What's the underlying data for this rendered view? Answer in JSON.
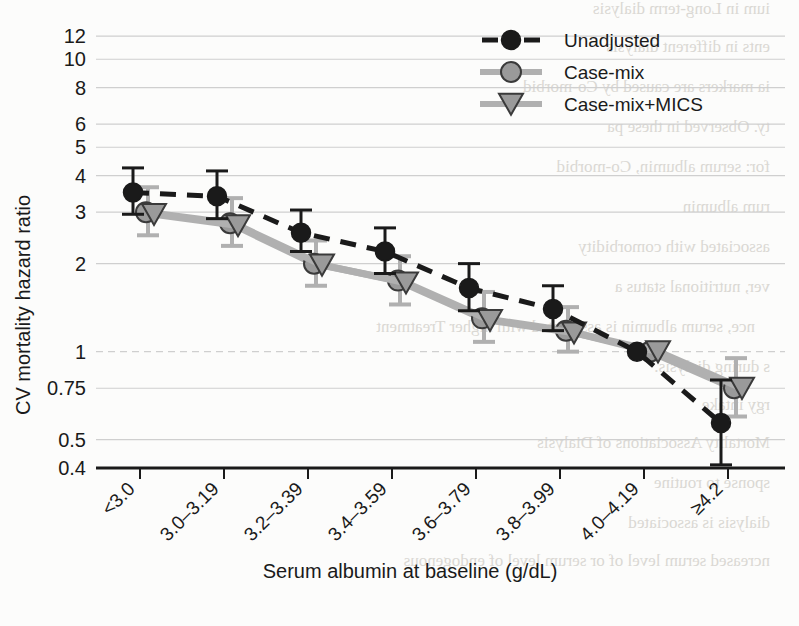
{
  "chart_data": {
    "type": "line",
    "title": "",
    "xlabel": "Serum albumin at baseline (g/dL)",
    "ylabel": "CV mortality hazard ratio",
    "yscale": "log",
    "ylim": [
      0.4,
      13.2
    ],
    "ytick_values": [
      12,
      10,
      8,
      6,
      5,
      4,
      3,
      2,
      1,
      0.75,
      0.5,
      0.4
    ],
    "ytick_labels": [
      "12",
      "10",
      "8",
      "6",
      "5",
      "4",
      "3",
      "2",
      "1",
      "0.75",
      "0.5",
      "0.4"
    ],
    "grid": true,
    "reference_line": 1,
    "legend_position": "top-right",
    "categories": [
      "<3.0",
      "3.0–3.19",
      "3.2–3.39",
      "3.4–3.59",
      "3.6–3.79",
      "3.8–3.99",
      "4.0–4.19",
      "≥4.2"
    ],
    "series": [
      {
        "name": "Unadjusted",
        "marker": "circle-filled",
        "line_style": "dashed",
        "color": "#1a1a1a",
        "values": [
          3.5,
          3.4,
          2.55,
          2.2,
          1.65,
          1.4,
          1.0,
          0.57
        ],
        "ci_low": [
          2.95,
          2.85,
          2.2,
          1.85,
          1.38,
          1.18,
          1.0,
          0.41
        ],
        "ci_high": [
          4.25,
          4.15,
          3.05,
          2.65,
          2.0,
          1.68,
          1.0,
          0.8
        ]
      },
      {
        "name": "Case-mix",
        "marker": "circle-open",
        "line_style": "solid",
        "color": "#a8a8a8",
        "values": [
          3.0,
          2.75,
          2.0,
          1.75,
          1.3,
          1.18,
          1.0,
          0.75
        ],
        "ci_low": [
          2.5,
          2.3,
          1.68,
          1.45,
          1.08,
          1.0,
          1.0,
          0.6
        ],
        "ci_high": [
          3.65,
          3.35,
          2.4,
          2.12,
          1.6,
          1.42,
          1.0,
          0.95
        ]
      },
      {
        "name": "Case-mix+MICS",
        "marker": "triangle-down",
        "line_style": "solid",
        "color": "#a8a8a8",
        "values": [
          2.95,
          2.7,
          1.98,
          1.72,
          1.28,
          1.16,
          1.0,
          0.75
        ],
        "ci_low": [
          2.5,
          2.3,
          1.68,
          1.45,
          1.08,
          1.0,
          1.0,
          0.6
        ],
        "ci_high": [
          3.65,
          3.35,
          2.4,
          2.12,
          1.6,
          1.42,
          1.0,
          0.95
        ]
      }
    ]
  },
  "axes": {
    "y_title": "CV mortality hazard ratio",
    "x_title": "Serum albumin at baseline (g/dL)"
  },
  "legend": {
    "entries": [
      {
        "label": "Unadjusted"
      },
      {
        "label": "Case-mix"
      },
      {
        "label": "Case-mix+MICS"
      }
    ]
  },
  "colors": {
    "unadjusted": "#1a1a1a",
    "case_mix": "#a8a8a8",
    "case_mix_mics": "#a8a8a8",
    "grid": "#cfcfcf",
    "axis": "#1a1a1a",
    "background": "#fcfcfb"
  },
  "background_bleed": {
    "lines": [
      "ium in Long-term dialysis",
      "ents in different dialysis",
      "ia markers are caused by Co-morbid",
      "ty. Observed in these pa",
      "for: serum albumin, Co-morbid",
      "rum albumin",
      "associated with comorbidity",
      "ver, nutritional status a",
      "nce, serum albumin is associated with higher Treatment",
      "s during dialysis.",
      "rgy intake",
      "Mortality Associations of Dialysis",
      "sponse to routine",
      "dialysis is associated",
      "ncreased serum level of or serum level of endogenous"
    ]
  }
}
